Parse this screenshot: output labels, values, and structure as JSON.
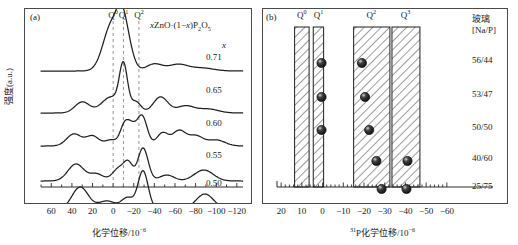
{
  "figure": {
    "background": "#ffffff",
    "line_color": "#1a1a1a",
    "marker_color": "#2b2b2b"
  },
  "panel_a": {
    "tag": "(a)",
    "formula_prefix": "x",
    "formula_mid": "ZnO·(1−",
    "formula_x": "x",
    "formula_suffix": ")P",
    "formula_sub1": "2",
    "formula_o": "O",
    "formula_sub2": "5",
    "ylabel": "强度(a.u.)",
    "xlabel_main": "化学位移/10",
    "xlabel_sup": "−6",
    "x_header": "x",
    "q_labels": [
      "Q",
      "Q",
      "Q"
    ],
    "q_sups": [
      "0",
      "1",
      "2"
    ],
    "q_positions_ppm": [
      0,
      -10,
      -25
    ],
    "tick_values": [
      60,
      40,
      20,
      0,
      -20,
      -40,
      -60,
      -80,
      -100,
      -120
    ],
    "tick_labels": [
      "60",
      "40",
      "20",
      "0",
      "−20",
      "−40",
      "−60",
      "−80",
      "−100",
      "−120"
    ],
    "axis_min_ppm": 70,
    "axis_max_ppm": -126,
    "traces": [
      {
        "x_value": "0.71",
        "baseline_y": 62,
        "peaks": [
          {
            "ppm": 1.5,
            "height": 46,
            "width": 11.5
          },
          {
            "ppm": -8,
            "height": 31,
            "width": 7
          },
          {
            "ppm": -14,
            "height": 22,
            "width": 8
          },
          {
            "ppm": -40,
            "height": 7,
            "width": 11
          },
          {
            "ppm": -63,
            "height": 6.5,
            "width": 13
          },
          {
            "ppm": -86,
            "height": 3,
            "width": 16
          }
        ]
      },
      {
        "x_value": "0.65",
        "baseline_y": 104,
        "peaks": [
          {
            "ppm": 30,
            "height": 11,
            "width": 10
          },
          {
            "ppm": 2,
            "height": 16,
            "width": 13
          },
          {
            "ppm": -10,
            "height": 44,
            "width": 5.5
          },
          {
            "ppm": -22,
            "height": 11,
            "width": 7
          },
          {
            "ppm": -46,
            "height": 16,
            "width": 10
          },
          {
            "ppm": -70,
            "height": 7,
            "width": 12
          },
          {
            "ppm": -92,
            "height": 4,
            "width": 14
          }
        ]
      },
      {
        "x_value": "0.60",
        "baseline_y": 137,
        "peaks": [
          {
            "ppm": 38,
            "height": 12,
            "width": 10
          },
          {
            "ppm": 20,
            "height": 10,
            "width": 9
          },
          {
            "ppm": 2,
            "height": 6,
            "width": 8
          },
          {
            "ppm": -11,
            "height": 20,
            "width": 6
          },
          {
            "ppm": -18,
            "height": 16,
            "width": 6
          },
          {
            "ppm": -28,
            "height": 30,
            "width": 7
          },
          {
            "ppm": -48,
            "height": 13,
            "width": 8
          },
          {
            "ppm": -64,
            "height": 15,
            "width": 9
          },
          {
            "ppm": -80,
            "height": 10,
            "width": 10
          },
          {
            "ppm": -100,
            "height": 6,
            "width": 12
          }
        ]
      },
      {
        "x_value": "0.55",
        "baseline_y": 172,
        "peaks": [
          {
            "ppm": 36,
            "height": 17,
            "width": 11
          },
          {
            "ppm": 16,
            "height": 7,
            "width": 9
          },
          {
            "ppm": -6,
            "height": 13,
            "width": 9
          },
          {
            "ppm": -15,
            "height": 15,
            "width": 6
          },
          {
            "ppm": -29,
            "height": 33,
            "width": 7
          },
          {
            "ppm": -52,
            "height": 6,
            "width": 10
          },
          {
            "ppm": -88,
            "height": 11,
            "width": 13
          }
        ]
      },
      {
        "x_value": "0.50",
        "baseline_y": 200,
        "peaks": [
          {
            "ppm": 32,
            "height": 22,
            "width": 11
          },
          {
            "ppm": 6,
            "height": 8,
            "width": 12
          },
          {
            "ppm": -14,
            "height": 11,
            "width": 8
          },
          {
            "ppm": -29,
            "height": 38,
            "width": 7
          },
          {
            "ppm": -54,
            "height": 4,
            "width": 9
          },
          {
            "ppm": -89,
            "height": 15,
            "width": 12
          }
        ]
      }
    ]
  },
  "panel_b": {
    "tag": "(b)",
    "xlabel_pre_sup": "31",
    "xlabel_main": "P化学位移/10",
    "xlabel_sup": "−6",
    "glass_header_line1": "玻璃",
    "glass_header_line2": "[Na/P]",
    "tick_values": [
      20,
      10,
      0,
      -10,
      -20,
      -30,
      -40,
      -50,
      -60
    ],
    "tick_labels": [
      "20",
      "10",
      "0",
      "−10",
      "−20",
      "−30",
      "−40",
      "−50",
      "−60"
    ],
    "axis_min_ppm": 22,
    "axis_max_ppm": -62,
    "bands": [
      {
        "label": "Q",
        "sup": "0",
        "start_ppm": 13.5,
        "end_ppm": 6.5,
        "label_ppm": 10
      },
      {
        "label": "Q",
        "sup": "1",
        "start_ppm": 4.5,
        "end_ppm": -0.5,
        "label_ppm": 2
      },
      {
        "label": "Q",
        "sup": "2",
        "start_ppm": -15,
        "end_ppm": -32.5,
        "label_ppm": -23.5
      },
      {
        "label": "Q",
        "sup": "3",
        "start_ppm": -33.5,
        "end_ppm": -47,
        "label_ppm": -40
      }
    ],
    "rows": [
      {
        "glass": "56/44",
        "y_px": 62,
        "points": [
          {
            "ppm": 0.5
          },
          {
            "ppm": -19
          }
        ]
      },
      {
        "glass": "53/47",
        "y_px": 96,
        "points": [
          {
            "ppm": 0.5
          },
          {
            "ppm": -20.5
          }
        ]
      },
      {
        "glass": "50/50",
        "y_px": 129,
        "points": [
          {
            "ppm": 0.5
          },
          {
            "ppm": -22.5
          }
        ]
      },
      {
        "glass": "40/60",
        "y_px": 160,
        "points": [
          {
            "ppm": -26
          },
          {
            "ppm": -41
          }
        ]
      },
      {
        "glass": "25/75",
        "y_px": 188,
        "points": [
          {
            "ppm": -28.5
          },
          {
            "ppm": -40.5
          }
        ]
      }
    ]
  },
  "chart_data": {
    "type": "line",
    "title": "",
    "panels": [
      {
        "name": "(a)",
        "type": "line",
        "xlabel": "化学位移/10−6",
        "ylabel": "强度(a.u.)",
        "xlim": [
          70,
          -126
        ],
        "grid": false,
        "annotation": "xZnO·(1−x)P2O5",
        "guide_lines_ppm": [
          0,
          -10,
          -25
        ],
        "guide_labels": [
          "Q0",
          "Q1",
          "Q2"
        ],
        "series": [
          {
            "name": "x = 0.71",
            "peaks_ppm": [
              1.5,
              -8,
              -14,
              -40,
              -63,
              -86
            ]
          },
          {
            "name": "x = 0.65",
            "peaks_ppm": [
              30,
              2,
              -10,
              -22,
              -46,
              -70,
              -92
            ]
          },
          {
            "name": "x = 0.60",
            "peaks_ppm": [
              38,
              20,
              2,
              -11,
              -18,
              -28,
              -48,
              -64,
              -80,
              -100
            ]
          },
          {
            "name": "x = 0.55",
            "peaks_ppm": [
              36,
              16,
              -6,
              -15,
              -29,
              -52,
              -88
            ]
          },
          {
            "name": "x = 0.50",
            "peaks_ppm": [
              32,
              6,
              -14,
              -29,
              -54,
              -89
            ]
          }
        ]
      },
      {
        "name": "(b)",
        "type": "scatter",
        "xlabel": "31P化学位移/10−6",
        "ylabel": "玻璃[Na/P]",
        "xlim": [
          22,
          -62
        ],
        "grid": false,
        "categories": [
          "56/44",
          "53/47",
          "50/50",
          "40/60",
          "25/75"
        ],
        "bands": [
          {
            "name": "Q0",
            "range_ppm": [
              13.5,
              6.5
            ]
          },
          {
            "name": "Q1",
            "range_ppm": [
              4.5,
              -0.5
            ]
          },
          {
            "name": "Q2",
            "range_ppm": [
              -15,
              -32.5
            ]
          },
          {
            "name": "Q3",
            "range_ppm": [
              -33.5,
              -47
            ]
          }
        ],
        "points": [
          {
            "glass": "56/44",
            "values_ppm": [
              0.5,
              -19
            ]
          },
          {
            "glass": "53/47",
            "values_ppm": [
              0.5,
              -20.5
            ]
          },
          {
            "glass": "50/50",
            "values_ppm": [
              0.5,
              -22.5
            ]
          },
          {
            "glass": "40/60",
            "values_ppm": [
              -26,
              -41
            ]
          },
          {
            "glass": "25/75",
            "values_ppm": [
              -28.5,
              -40.5
            ]
          }
        ]
      }
    ]
  }
}
